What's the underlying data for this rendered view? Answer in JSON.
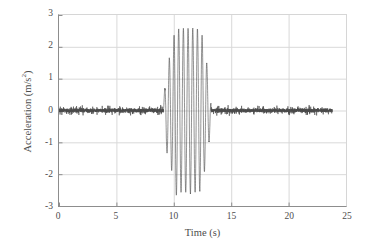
{
  "chart_data": {
    "type": "line",
    "title": "",
    "xlabel": "Time (s)",
    "ylabel_text": "Acceleration (m/s",
    "ylabel_sup": "2",
    "ylabel_tail": ")",
    "ylabel_full": "Acceleration (m/s2)",
    "xlim": [
      0,
      25
    ],
    "ylim": [
      -3,
      3
    ],
    "xticks": [
      0,
      5,
      10,
      15,
      20,
      25
    ],
    "xtick_labels": [
      "0",
      "5",
      "10",
      "15",
      "20",
      "25"
    ],
    "yticks": [
      3,
      2,
      1,
      0,
      -1,
      -2,
      -3
    ],
    "ytick_labels": [
      "3",
      "2",
      "1",
      "0",
      "-1",
      "-2",
      "-3"
    ],
    "grid": true,
    "grid_color": "#d9d9d9",
    "axis_color": "#8d8d8d",
    "legend": "none",
    "series": [
      {
        "name": "Acceleration signal",
        "color": "#4a4a4a",
        "line_width": 0.6,
        "x_start": 0.0,
        "x_end": 23.8,
        "sample_rate_hz": 200,
        "description": "Low-amplitude broadband noise baseline near 0 m/s2 with a single high-amplitude sinusoidal burst between about 9.1 s and 13.2 s.",
        "baseline": {
          "mean": 0.0,
          "noise_amplitude": 0.09,
          "noise_peak": 0.16
        },
        "burst": {
          "t_start": 9.1,
          "t_end": 13.2,
          "frequency_hz": 2.45,
          "peak_positive": 2.7,
          "peak_negative": -2.72,
          "peak_time": 10.15,
          "envelope_profile": [
            {
              "t": 9.1,
              "amp": 0.25
            },
            {
              "t": 9.35,
              "amp": 1.25
            },
            {
              "t": 9.6,
              "amp": 1.62
            },
            {
              "t": 9.85,
              "amp": 1.92
            },
            {
              "t": 10.15,
              "amp": 2.7
            },
            {
              "t": 10.45,
              "amp": 2.55
            },
            {
              "t": 10.8,
              "amp": 2.58
            },
            {
              "t": 11.1,
              "amp": 2.56
            },
            {
              "t": 11.45,
              "amp": 2.6
            },
            {
              "t": 11.8,
              "amp": 2.55
            },
            {
              "t": 12.1,
              "amp": 2.56
            },
            {
              "t": 12.4,
              "amp": 2.52
            },
            {
              "t": 12.65,
              "amp": 1.95
            },
            {
              "t": 12.85,
              "amp": 1.55
            },
            {
              "t": 13.0,
              "amp": 1.18
            },
            {
              "t": 13.15,
              "amp": 0.78
            },
            {
              "t": 13.25,
              "amp": 0.2
            }
          ]
        }
      }
    ]
  }
}
